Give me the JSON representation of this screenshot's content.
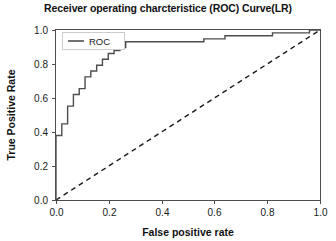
{
  "chart_data": {
    "type": "line",
    "title": "Receiver operating charcteristice (ROC) Curve(LR)",
    "xlabel": "False positive rate",
    "ylabel": "True Positive Rate",
    "xlim": [
      0.0,
      1.0
    ],
    "ylim": [
      0.0,
      1.0
    ],
    "xticks": [
      "0.0",
      "0.2",
      "0.4",
      "0.6",
      "0.8",
      "1.0"
    ],
    "xtick_values": [
      0.0,
      0.2,
      0.4,
      0.6,
      0.8,
      1.0
    ],
    "yticks": [
      "0.0",
      "0.2",
      "0.4",
      "0.6",
      "0.8",
      "1.0"
    ],
    "ytick_values": [
      0.0,
      0.2,
      0.4,
      0.6,
      0.8,
      1.0
    ],
    "grid": false,
    "legend_position": "upper left",
    "series": [
      {
        "name": "ROC",
        "style": "solid",
        "color": "#4d4d4d",
        "points": [
          [
            0.0,
            0.0
          ],
          [
            0.0,
            0.379
          ],
          [
            0.022,
            0.379
          ],
          [
            0.022,
            0.448
          ],
          [
            0.044,
            0.448
          ],
          [
            0.044,
            0.552
          ],
          [
            0.066,
            0.552
          ],
          [
            0.066,
            0.621
          ],
          [
            0.088,
            0.621
          ],
          [
            0.088,
            0.655
          ],
          [
            0.11,
            0.655
          ],
          [
            0.11,
            0.724
          ],
          [
            0.132,
            0.724
          ],
          [
            0.132,
            0.759
          ],
          [
            0.154,
            0.759
          ],
          [
            0.154,
            0.793
          ],
          [
            0.176,
            0.793
          ],
          [
            0.176,
            0.828
          ],
          [
            0.198,
            0.828
          ],
          [
            0.198,
            0.862
          ],
          [
            0.22,
            0.862
          ],
          [
            0.22,
            0.879
          ],
          [
            0.242,
            0.879
          ],
          [
            0.242,
            0.897
          ],
          [
            0.264,
            0.897
          ],
          [
            0.264,
            0.931
          ],
          [
            0.56,
            0.931
          ],
          [
            0.56,
            0.948
          ],
          [
            0.64,
            0.948
          ],
          [
            0.64,
            0.966
          ],
          [
            0.82,
            0.966
          ],
          [
            0.82,
            0.983
          ],
          [
            0.96,
            0.983
          ],
          [
            0.96,
            1.0
          ],
          [
            1.0,
            1.0
          ]
        ]
      },
      {
        "name": "chance-diagonal",
        "style": "dashed",
        "color": "#1a1a1a",
        "points": [
          [
            0.0,
            0.0
          ],
          [
            1.0,
            1.0
          ]
        ]
      }
    ],
    "legend": [
      {
        "label": "ROC",
        "style": "solid",
        "color": "#4d4d4d"
      }
    ]
  },
  "colors": {
    "roc_line": "#4d4d4d",
    "diagonal_line": "#1a1a1a",
    "axis": "#4d4d4d",
    "text": "#111111",
    "background": "#ffffff",
    "legend_border": "#cccccc"
  }
}
